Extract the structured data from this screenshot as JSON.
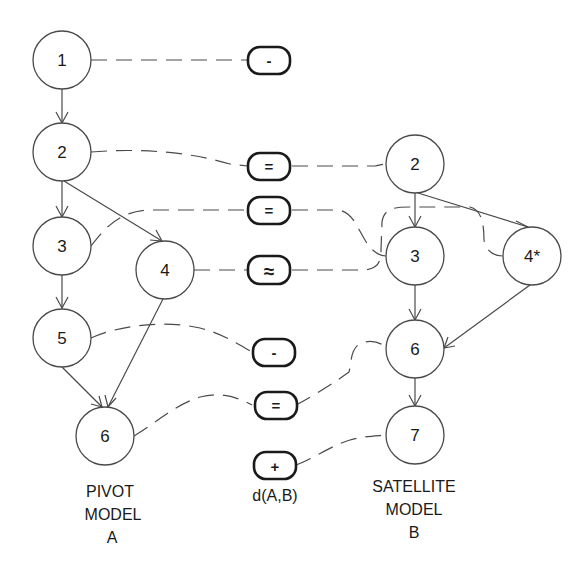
{
  "pivot_model": {
    "label_lines": [
      "PIVOT",
      "MODEL",
      "A"
    ],
    "nodes": [
      {
        "id": "A1",
        "label": "1",
        "cx": 62,
        "cy": 60
      },
      {
        "id": "A2",
        "label": "2",
        "cx": 62,
        "cy": 152
      },
      {
        "id": "A3",
        "label": "3",
        "cx": 62,
        "cy": 246
      },
      {
        "id": "A4",
        "label": "4",
        "cx": 165,
        "cy": 270
      },
      {
        "id": "A5",
        "label": "5",
        "cx": 62,
        "cy": 338
      },
      {
        "id": "A6",
        "label": "6",
        "cx": 105,
        "cy": 436
      }
    ],
    "edges": [
      [
        "A1",
        "A2"
      ],
      [
        "A2",
        "A3"
      ],
      [
        "A2",
        "A4"
      ],
      [
        "A3",
        "A5"
      ],
      [
        "A5",
        "A6"
      ],
      [
        "A4",
        "A6"
      ]
    ]
  },
  "satellite_model": {
    "label_lines": [
      "SATELLITE",
      "MODEL",
      "B"
    ],
    "nodes": [
      {
        "id": "B2",
        "label": "2",
        "cx": 415,
        "cy": 164
      },
      {
        "id": "B3",
        "label": "3",
        "cx": 415,
        "cy": 256
      },
      {
        "id": "B4",
        "label": "4*",
        "cx": 532,
        "cy": 256
      },
      {
        "id": "B6",
        "label": "6",
        "cx": 415,
        "cy": 349
      },
      {
        "id": "B7",
        "label": "7",
        "cx": 415,
        "cy": 435
      }
    ],
    "edges": [
      [
        "B2",
        "B3"
      ],
      [
        "B2",
        "B4"
      ],
      [
        "B3",
        "B6"
      ],
      [
        "B4",
        "B6"
      ],
      [
        "B6",
        "B7"
      ]
    ]
  },
  "diff": {
    "label": "d(A,B)",
    "operations": [
      {
        "symbol": "-",
        "meaning": "deleted",
        "from": "A1",
        "to": null,
        "cy": 60
      },
      {
        "symbol": "=",
        "meaning": "equal",
        "from": "A2",
        "to": "B2",
        "cy": 166
      },
      {
        "symbol": "=",
        "meaning": "equal",
        "from": "A3",
        "to": "B3",
        "cy": 210
      },
      {
        "symbol": "≈",
        "meaning": "similar",
        "from": "A4",
        "to": "B4",
        "cy": 270
      },
      {
        "symbol": "-",
        "meaning": "deleted",
        "from": "A5",
        "to": null,
        "cy": 352
      },
      {
        "symbol": "=",
        "meaning": "equal",
        "from": "A6",
        "to": "B6",
        "cy": 405
      },
      {
        "symbol": "+",
        "meaning": "added",
        "from": null,
        "to": "B7",
        "cy": 466
      }
    ]
  },
  "colors": {
    "stroke": "#4a4a4a",
    "box_stroke": "#1a1a1a",
    "background": "#ffffff"
  }
}
